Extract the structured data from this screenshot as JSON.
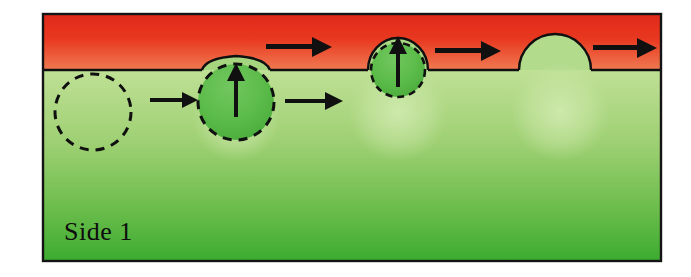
{
  "figure": {
    "name": "bubble-nucleation-growth-diagram",
    "caption_label": "Side 1",
    "frame": {
      "x": 42,
      "y": 13,
      "width": 620,
      "height": 249,
      "border_color": "#101010",
      "border_width": 2
    },
    "phases": {
      "upper": {
        "name": "upper-red-phase",
        "label": "",
        "color_top": "#e8301d",
        "color_bottom": "#ee6a4a",
        "y_top": 13,
        "y_interface": 70
      },
      "lower": {
        "name": "lower-green-phase",
        "label": "Side 1",
        "color_top": "#b9dd8d",
        "color_bottom": "#3fae32",
        "y_interface": 70,
        "y_bottom": 262
      }
    },
    "interface_line": {
      "y": 70,
      "color": "#101010",
      "width": 2
    },
    "bubbles": [
      {
        "id": "bubble-1-nucleus",
        "label": "",
        "cx": 93,
        "cy": 112,
        "r": 38,
        "style": "dashed-outline-only",
        "fill": "none",
        "stroke": "#101010",
        "dash": "9 7",
        "has_up_arrow": false,
        "bump_height": 0
      },
      {
        "id": "bubble-2-growing",
        "label": "",
        "cx": 236,
        "cy": 102,
        "r": 38,
        "style": "dashed-outline-filled",
        "fill": "#55b947",
        "stroke": "#101010",
        "dash": "9 7",
        "has_up_arrow": true,
        "bump_height": 14,
        "bump_half_width": 34
      },
      {
        "id": "bubble-3-emerging",
        "label": "",
        "cx": 398,
        "cy": 70,
        "r": 27,
        "style": "dashed-outline-filled",
        "fill": "#55b947",
        "stroke": "#101010",
        "dash": "7 5",
        "has_up_arrow": true,
        "bump_height": 32,
        "bump_half_width": 30
      },
      {
        "id": "bubble-4-released",
        "label": "",
        "cx": 555,
        "cy": 70,
        "r": 36,
        "style": "solid-dome-only",
        "fill": "#b9dd8d",
        "stroke": "#101010",
        "dash": "none",
        "has_up_arrow": false,
        "bump_height": 36,
        "bump_half_width": 36
      }
    ],
    "ghost_bubbles": [
      {
        "id": "ghost-bubble-a",
        "cx": 236,
        "cy": 118,
        "r": 44
      },
      {
        "id": "ghost-bubble-b",
        "cx": 398,
        "cy": 112,
        "r": 50
      },
      {
        "id": "ghost-bubble-c",
        "cx": 560,
        "cy": 112,
        "r": 50
      }
    ],
    "arrows": {
      "color": "#101010",
      "horizontal": [
        {
          "id": "arrow-nucleus-to-bubble",
          "region": "green",
          "x1": 150,
          "x2": 196,
          "y": 100,
          "shaft_width": 4,
          "head_length": 14,
          "head_half_height": 8
        },
        {
          "id": "arrow-bubble-growth",
          "region": "green",
          "x1": 285,
          "x2": 341,
          "y": 101,
          "shaft_width": 4,
          "head_length": 16,
          "head_half_height": 9
        },
        {
          "id": "arrow-flow-upper-1",
          "region": "red",
          "x1": 266,
          "x2": 331,
          "y": 47,
          "shaft_width": 5,
          "head_length": 18,
          "head_half_height": 10
        },
        {
          "id": "arrow-flow-upper-2",
          "region": "red",
          "x1": 435,
          "x2": 500,
          "y": 51,
          "shaft_width": 5,
          "head_length": 18,
          "head_half_height": 10
        },
        {
          "id": "arrow-flow-upper-3",
          "region": "red",
          "x1": 593,
          "x2": 656,
          "y": 48,
          "shaft_width": 5,
          "head_length": 18,
          "head_half_height": 10
        }
      ],
      "vertical": [
        {
          "id": "arrow-rise-bubble-2",
          "x": 236,
          "y_base": 117,
          "y_tip": 63,
          "shaft_width": 4,
          "head_length": 16,
          "head_half_width": 9
        },
        {
          "id": "arrow-rise-bubble-3",
          "x": 398,
          "y_base": 87,
          "y_tip": 36,
          "shaft_width": 4,
          "head_length": 16,
          "head_half_width": 9
        }
      ]
    },
    "label_text": {
      "side_1": {
        "text": "Side 1",
        "x": 64,
        "y": 240,
        "font_size": 26,
        "color": "#0d0d0d"
      }
    }
  }
}
